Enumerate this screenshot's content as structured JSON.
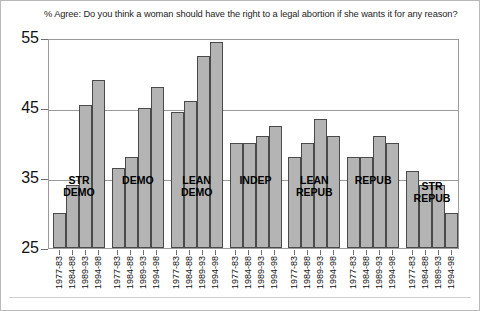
{
  "chart_data": {
    "type": "bar",
    "title": "% Agree: Do you think a woman should have the right to a legal abortion if she wants it for any reason?",
    "xlabel": "",
    "ylabel": "",
    "ylim": [
      25,
      55
    ],
    "yticks": [
      25,
      35,
      45,
      55
    ],
    "grid": true,
    "legend": "none",
    "categories": [
      "1977-83",
      "1984-88",
      "1989-93",
      "1994-98"
    ],
    "groups": [
      {
        "label": "STR\nDEMO",
        "label_short": "STR DEMO",
        "values": [
          30.0,
          34.0,
          45.5,
          49.0
        ]
      },
      {
        "label": "DEMO",
        "label_short": "DEMO",
        "values": [
          36.5,
          38.0,
          45.0,
          48.0
        ]
      },
      {
        "label": "LEAN\nDEMO",
        "label_short": "LEAN DEMO",
        "values": [
          44.5,
          46.0,
          52.5,
          54.5
        ]
      },
      {
        "label": "INDEP",
        "label_short": "INDEP",
        "values": [
          40.0,
          40.0,
          41.0,
          42.5
        ]
      },
      {
        "label": "LEAN\nREPUB",
        "label_short": "LEAN REPUB",
        "values": [
          38.0,
          40.0,
          43.5,
          41.0
        ]
      },
      {
        "label": "REPUB",
        "label_short": "REPUB",
        "values": [
          38.0,
          38.0,
          41.0,
          40.0
        ]
      },
      {
        "label": "STR\nREPUB",
        "label_short": "STR REPUB",
        "values": [
          36.0,
          34.0,
          34.0,
          30.0
        ]
      }
    ],
    "colors": {
      "bar_fill": "#b4b4b4",
      "bar_border": "#4a4a4a",
      "axis": "#9a9a9a",
      "text": "#111111",
      "background": "#ffffff"
    }
  }
}
